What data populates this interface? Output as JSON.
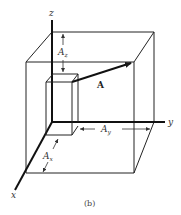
{
  "figure": {
    "caption": "(b)",
    "axes": {
      "x_label": "x",
      "y_label": "y",
      "z_label": "z"
    },
    "vector_label": "A",
    "components": {
      "ax": {
        "letter": "A",
        "sub": "x"
      },
      "ay": {
        "letter": "A",
        "sub": "y"
      },
      "az": {
        "letter": "A",
        "sub": "z"
      }
    },
    "colors": {
      "line": "#1a1a1a",
      "text": "#333333",
      "background": "#ffffff"
    }
  }
}
